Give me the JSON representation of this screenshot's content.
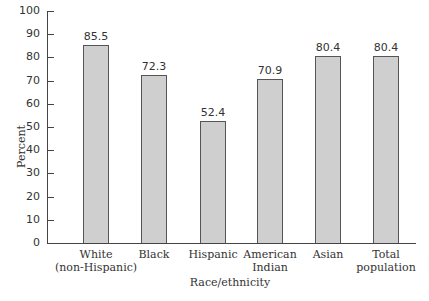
{
  "chart_data": {
    "type": "bar",
    "title": "",
    "xlabel": "Race/ethnicity",
    "ylabel": "Percent",
    "ylim": [
      0,
      100
    ],
    "yticks": [
      0,
      10,
      20,
      30,
      40,
      50,
      60,
      70,
      80,
      90,
      100
    ],
    "grid": false,
    "legend": null,
    "categories": [
      "White (non-Hispanic)",
      "Black",
      "Hispanic",
      "American Indian",
      "Asian",
      "Total population"
    ],
    "category_lines": [
      [
        "White",
        "(non-Hispanic)"
      ],
      [
        "Black"
      ],
      [
        "Hispanic"
      ],
      [
        "American",
        "Indian"
      ],
      [
        "Asian"
      ],
      [
        "Total",
        "population"
      ]
    ],
    "values": [
      85.5,
      72.3,
      52.4,
      70.9,
      80.4,
      80.4
    ],
    "value_labels": [
      "85.5",
      "72.3",
      "52.4",
      "70.9",
      "80.4",
      "80.4"
    ],
    "bar_color": "#cfcfcf"
  }
}
